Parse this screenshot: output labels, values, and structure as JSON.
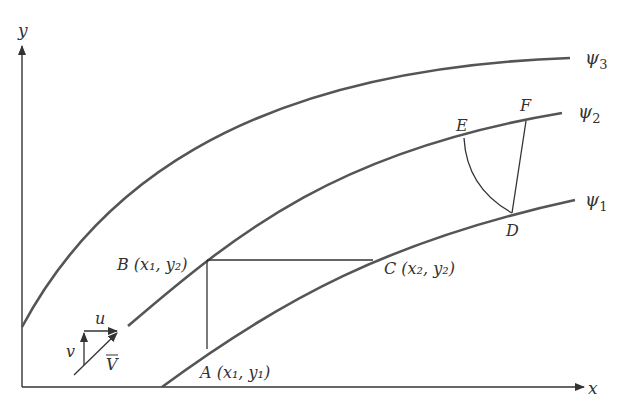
{
  "axes": {
    "x_label": "x",
    "y_label": "y"
  },
  "streamlines": [
    {
      "label": "ψ",
      "sub": "1",
      "id": "psi-1"
    },
    {
      "label": "ψ",
      "sub": "2",
      "id": "psi-2"
    },
    {
      "label": "ψ",
      "sub": "3",
      "id": "psi-3"
    }
  ],
  "points": {
    "A": {
      "name": "A",
      "coord": "(x₁, y₁)"
    },
    "B": {
      "name": "B",
      "coord": "(x₁, y₂)"
    },
    "C": {
      "name": "C",
      "coord": "(x₂, y₂)"
    },
    "D": {
      "name": "D"
    },
    "E": {
      "name": "E"
    },
    "F": {
      "name": "F"
    }
  },
  "velocity": {
    "u_label": "u",
    "v_label": "v",
    "V_label": "V"
  },
  "colors": {
    "curve": "#555555",
    "line": "#333333",
    "background": "#ffffff"
  }
}
